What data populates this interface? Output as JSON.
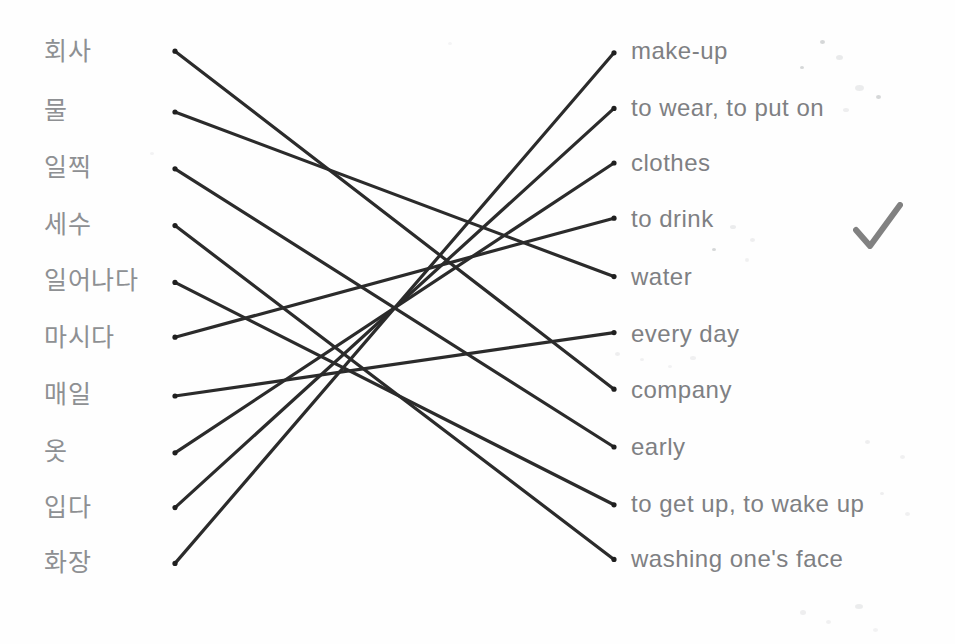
{
  "worksheet": {
    "title": "Korean vocabulary matching exercise",
    "background_color": "#fefefe",
    "ink_color": "#2b2b2b",
    "text_color": "#8e9093",
    "mark": {
      "name": "checkmark",
      "label": "✓",
      "color": "#1c1c1c",
      "x": 855,
      "y": 205
    }
  },
  "left_column": {
    "name": "korean-terms",
    "items": [
      {
        "id": "l1",
        "label": "회사",
        "y": 52
      },
      {
        "id": "l2",
        "label": "물",
        "y": 112
      },
      {
        "id": "l3",
        "label": "일찍",
        "y": 168
      },
      {
        "id": "l4",
        "label": "세수",
        "y": 226
      },
      {
        "id": "l5",
        "label": "일어나다",
        "y": 282
      },
      {
        "id": "l6",
        "label": "마시다",
        "y": 338
      },
      {
        "id": "l7",
        "label": "매일",
        "y": 396
      },
      {
        "id": "l8",
        "label": "옷",
        "y": 452
      },
      {
        "id": "l9",
        "label": "입다",
        "y": 508
      },
      {
        "id": "l10",
        "label": "화장",
        "y": 563
      }
    ]
  },
  "right_column": {
    "name": "english-meanings",
    "items": [
      {
        "id": "r1",
        "label": "make-up",
        "y": 52
      },
      {
        "id": "r2",
        "label": "to wear, to put on",
        "y": 108
      },
      {
        "id": "r3",
        "label": "clothes",
        "y": 163
      },
      {
        "id": "r4",
        "label": "to drink",
        "y": 219
      },
      {
        "id": "r5",
        "label": "water",
        "y": 277
      },
      {
        "id": "r6",
        "label": "every day",
        "y": 333
      },
      {
        "id": "r7",
        "label": "company",
        "y": 390
      },
      {
        "id": "r8",
        "label": "early",
        "y": 447
      },
      {
        "id": "r9",
        "label": "to get up, to wake up",
        "y": 504
      },
      {
        "id": "r10",
        "label": "washing one's face",
        "y": 559
      }
    ]
  },
  "connections": [
    {
      "from": "l1",
      "to": "r7",
      "from_label": "회사",
      "to_label": "company"
    },
    {
      "from": "l2",
      "to": "r5",
      "from_label": "물",
      "to_label": "water"
    },
    {
      "from": "l3",
      "to": "r8",
      "from_label": "일찍",
      "to_label": "early"
    },
    {
      "from": "l4",
      "to": "r10",
      "from_label": "세수",
      "to_label": "washing one's face"
    },
    {
      "from": "l5",
      "to": "r9",
      "from_label": "일어나다",
      "to_label": "to get up, to wake up"
    },
    {
      "from": "l6",
      "to": "r4",
      "from_label": "마시다",
      "to_label": "to drink"
    },
    {
      "from": "l7",
      "to": "r6",
      "from_label": "매일",
      "to_label": "every day"
    },
    {
      "from": "l8",
      "to": "r3",
      "from_label": "옷",
      "to_label": "clothes"
    },
    {
      "from": "l9",
      "to": "r2",
      "from_label": "입다",
      "to_label": "to wear, to put on"
    },
    {
      "from": "l10",
      "to": "r1",
      "from_label": "화장",
      "to_label": "make-up"
    }
  ],
  "geometry": {
    "left_anchor_x": 175,
    "right_anchor_x": 614,
    "left_text_x": 44,
    "right_text_x": 631
  }
}
